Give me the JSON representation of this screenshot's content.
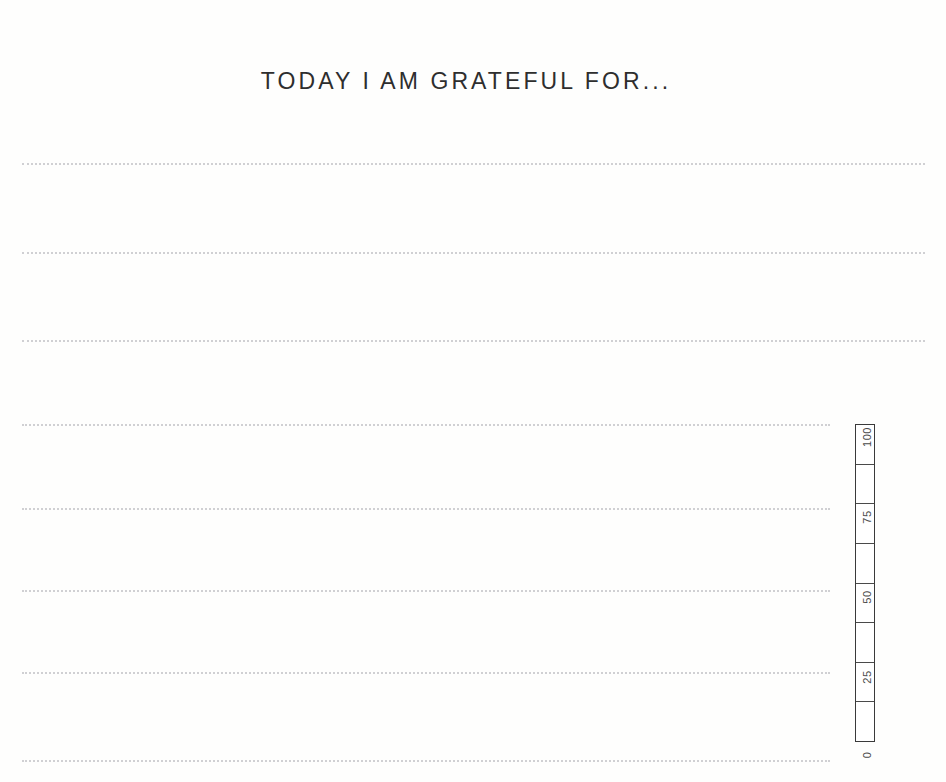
{
  "page": {
    "title": "TODAY I AM GRATEFUL FOR...",
    "background_color": "#fdfdfc",
    "ink_color": "#2e2e2e",
    "rule_color": "#c9c9cc"
  },
  "writing_lines": [
    {
      "id": "line-1",
      "y": 163,
      "x": 22,
      "width": 903
    },
    {
      "id": "line-2",
      "y": 252,
      "x": 22,
      "width": 903
    },
    {
      "id": "line-3",
      "y": 340,
      "x": 22,
      "width": 903
    },
    {
      "id": "line-4",
      "y": 424,
      "x": 22,
      "width": 808
    },
    {
      "id": "line-5",
      "y": 508,
      "x": 22,
      "width": 808
    },
    {
      "id": "line-6",
      "y": 590,
      "x": 22,
      "width": 808
    },
    {
      "id": "line-7",
      "y": 672,
      "x": 22,
      "width": 808
    },
    {
      "id": "line-8",
      "y": 760,
      "x": 22,
      "width": 808
    }
  ],
  "scale": {
    "axis_title": "HAPPINESS SCALE (%)",
    "segments": 8,
    "tick_labels": [
      {
        "value": "100",
        "top": 418
      },
      {
        "value": "75",
        "top": 498
      },
      {
        "value": "50",
        "top": 578
      },
      {
        "value": "25",
        "top": 658
      },
      {
        "value": "0",
        "top": 736
      }
    ]
  },
  "chart_data": {
    "type": "bar",
    "title": "HAPPINESS SCALE (%)",
    "xlabel": "",
    "ylabel": "HAPPINESS SCALE (%)",
    "orientation": "vertical",
    "categories": [
      "happiness"
    ],
    "values": [
      0
    ],
    "ylim": [
      0,
      100
    ],
    "tick_labels": [
      "0",
      "25",
      "50",
      "75",
      "100"
    ],
    "ticks": [
      0,
      25,
      50,
      75,
      100
    ],
    "segment_boundaries": [
      0,
      12.5,
      25,
      37.5,
      50,
      62.5,
      75,
      87.5,
      100
    ],
    "grid": false,
    "legend": "none",
    "note": "Blank fill-in gauge: 8 empty segments, no value shaded"
  }
}
